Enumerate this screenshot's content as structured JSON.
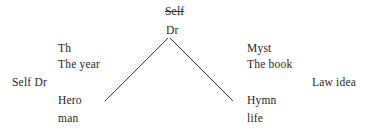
{
  "diagram": {
    "type": "tree",
    "background_color": "#ffffff",
    "text_color": "#1f1f1f",
    "edge_color": "#3a3a3a",
    "root": {
      "struck_label": "Self",
      "label": "Dr",
      "strikethrough": true
    },
    "left_branch": {
      "upper": [
        "Th",
        "The year"
      ],
      "lower": [
        "Hero",
        "man"
      ]
    },
    "right_branch": {
      "upper": [
        "Myst",
        "The book"
      ],
      "lower": [
        "Hymn",
        "life"
      ]
    },
    "far_left_label": "Self Dr",
    "far_right_label": "Law idea",
    "edges": [
      {
        "name": "left-edge",
        "x1": 168,
        "y1": 38,
        "x2": 105,
        "y2": 101
      },
      {
        "name": "right-edge",
        "x1": 170,
        "y1": 38,
        "x2": 233,
        "y2": 101
      }
    ]
  }
}
